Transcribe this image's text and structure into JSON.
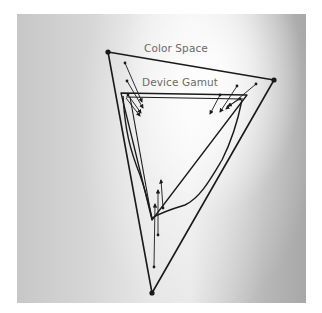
{
  "labels": {
    "color_space": "Color Space",
    "device_gamut": "Device Gamut"
  },
  "colors": {
    "line": "#1a1a1a",
    "label": "#6a6a6a",
    "panel_dark": "#a8a8a8",
    "panel_light": "#f2f2f2"
  },
  "diagram": {
    "color_space_triangle": {
      "vertices": [
        [
          108,
          52
        ],
        [
          274,
          80
        ],
        [
          152,
          293
        ]
      ]
    },
    "device_gamut_rectangle": {
      "corners": [
        [
          121,
          93
        ],
        [
          247,
          95
        ],
        [
          152,
          220
        ]
      ]
    },
    "device_gamut_curve": "closed irregular curve inside color space",
    "mapping_arrows": {
      "upper_left": 4,
      "upper_right": 4,
      "bottom": 3
    }
  }
}
